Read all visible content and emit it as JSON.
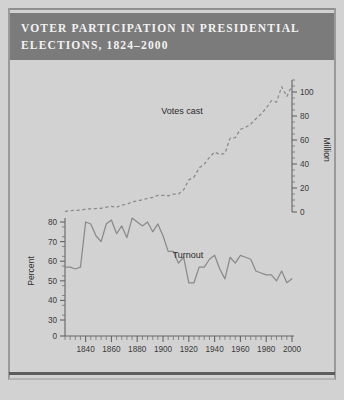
{
  "title": {
    "line1": "VOTER PARTICIPATION IN PRESIDENTIAL",
    "line2": "ELECTIONS, 1824–2000"
  },
  "colors": {
    "page_background": "#d2d2d2",
    "title_band": "#7b7b7b",
    "title_text": "#f2f2f2",
    "line": "#8a8a8a",
    "axis": "#646464",
    "rule": "#5d5d5d"
  },
  "chart_data": {
    "type": "line",
    "title": "VOTER PARTICIPATION IN PRESIDENTIAL ELECTIONS, 1824–2000",
    "xlabel": "",
    "xlim": [
      1824,
      2000
    ],
    "x_ticks": [
      1840,
      1860,
      1880,
      1900,
      1920,
      1940,
      1960,
      1980,
      2000
    ],
    "x_tick_labels": [
      "1840",
      "1860",
      "1880",
      "1900",
      "1920",
      "1940",
      "1960",
      "1980",
      "2000"
    ],
    "x_minor_step": 4,
    "grid": false,
    "legend": "inline-labels",
    "panels": [
      {
        "name": "votes-cast-panel",
        "axis_side": "right",
        "ylabel": "Million",
        "ylim": [
          0,
          110
        ],
        "y_ticks": [
          0,
          20,
          40,
          60,
          80,
          100
        ],
        "y_tick_labels": [
          "0",
          "20",
          "40",
          "60",
          "80",
          "100"
        ],
        "y_minor_step": 5,
        "series": [
          {
            "name": "Votes cast",
            "label": "Votes cast",
            "style": "dashed",
            "x": [
              1824,
              1828,
              1832,
              1836,
              1840,
              1844,
              1848,
              1852,
              1856,
              1860,
              1864,
              1868,
              1872,
              1876,
              1880,
              1884,
              1888,
              1892,
              1896,
              1900,
              1904,
              1908,
              1912,
              1916,
              1920,
              1924,
              1928,
              1932,
              1936,
              1940,
              1944,
              1948,
              1952,
              1956,
              1960,
              1964,
              1968,
              1972,
              1976,
              1980,
              1984,
              1988,
              1992,
              1996,
              2000
            ],
            "values": [
              0.4,
              1.2,
              1.3,
              1.5,
              2.4,
              2.7,
              2.9,
              3.1,
              4.1,
              4.7,
              4.0,
              5.7,
              6.5,
              8.4,
              9.2,
              10.1,
              11.4,
              12.1,
              13.9,
              13.9,
              13.5,
              14.9,
              15.0,
              18.5,
              26.8,
              29.1,
              36.8,
              39.8,
              45.6,
              49.9,
              48.0,
              48.8,
              61.6,
              62.0,
              68.8,
              70.6,
              73.2,
              77.7,
              81.6,
              86.5,
              92.7,
              91.6,
              104.4,
              96.3,
              105.4
            ]
          }
        ]
      },
      {
        "name": "turnout-panel",
        "axis_side": "left",
        "ylabel": "Percent",
        "ylim": [
          0,
          85
        ],
        "y_ticks": [
          0,
          30,
          40,
          50,
          60,
          70,
          80
        ],
        "y_tick_labels": [
          "0",
          "30",
          "40",
          "50",
          "60",
          "70",
          "80"
        ],
        "broken_axis": true,
        "series": [
          {
            "name": "Turnout",
            "label": "Turnout",
            "style": "solid",
            "x": [
              1824,
              1828,
              1832,
              1836,
              1840,
              1844,
              1848,
              1852,
              1856,
              1860,
              1864,
              1868,
              1872,
              1876,
              1880,
              1884,
              1888,
              1892,
              1896,
              1900,
              1904,
              1908,
              1912,
              1916,
              1920,
              1924,
              1928,
              1932,
              1936,
              1940,
              1944,
              1948,
              1952,
              1956,
              1960,
              1964,
              1968,
              1972,
              1976,
              1980,
              1984,
              1988,
              1992,
              1996,
              2000
            ],
            "values": [
              57.0,
              57.0,
              56.0,
              57.0,
              80.0,
              79.0,
              73.0,
              70.0,
              79.0,
              81.0,
              74.0,
              78.0,
              72.0,
              82.0,
              80.0,
              78.0,
              80.0,
              75.0,
              79.0,
              73.0,
              65.0,
              65.0,
              59.0,
              62.0,
              49.0,
              49.0,
              57.0,
              57.0,
              61.0,
              63.0,
              56.0,
              51.0,
              62.0,
              59.0,
              63.0,
              62.0,
              61.0,
              55.0,
              54.0,
              53.0,
              53.0,
              50.0,
              55.0,
              49.0,
              51.0
            ]
          }
        ]
      }
    ]
  }
}
